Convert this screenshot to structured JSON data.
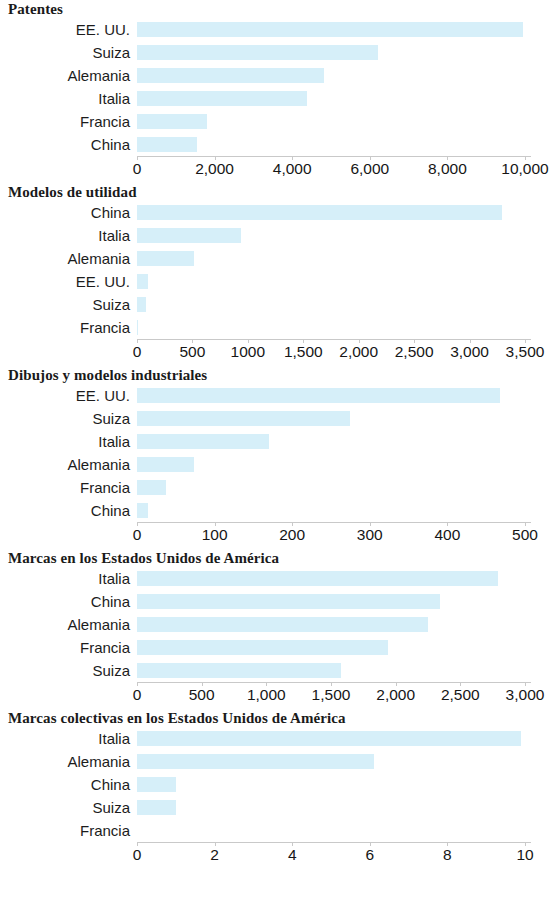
{
  "page": {
    "bar_color": "#d6eff9",
    "axis_color": "#c9c9c9",
    "text_color": "#1c1c1c"
  },
  "chart_data": [
    {
      "type": "bar",
      "orientation": "horizontal",
      "title": "Patentes",
      "xlabel": "",
      "ylabel": "",
      "categories": [
        "EE. UU.",
        "Suiza",
        "Alemania",
        "Italia",
        "Francia",
        "China"
      ],
      "values": [
        9950,
        6200,
        4830,
        4380,
        1800,
        1540
      ],
      "xlim": [
        0,
        10000
      ],
      "ticks": [
        0,
        2000,
        4000,
        6000,
        8000,
        10000
      ],
      "tick_labels": [
        "0",
        "2,000",
        "4,000",
        "6,000",
        "8,000",
        "10,000"
      ],
      "grid": false,
      "legend": "none"
    },
    {
      "type": "bar",
      "orientation": "horizontal",
      "title": "Modelos de utilidad",
      "xlabel": "",
      "ylabel": "",
      "categories": [
        "China",
        "Italia",
        "Alemania",
        "EE. UU.",
        "Suiza",
        "Francia"
      ],
      "values": [
        3290,
        940,
        510,
        95,
        85,
        10
      ],
      "xlim": [
        0,
        3500
      ],
      "ticks": [
        0,
        500,
        1000,
        1500,
        2000,
        2500,
        3000,
        3500
      ],
      "tick_labels": [
        "0",
        "500",
        "1000",
        "1,500",
        "2,000",
        "2,500",
        "3,000",
        "3,500"
      ],
      "grid": false,
      "legend": "none"
    },
    {
      "type": "bar",
      "orientation": "horizontal",
      "title": "Dibujos y modelos industriales",
      "xlabel": "",
      "ylabel": "",
      "categories": [
        "EE. UU.",
        "Suiza",
        "Italia",
        "Alemania",
        "Francia",
        "China"
      ],
      "values": [
        468,
        275,
        170,
        74,
        38,
        14
      ],
      "xlim": [
        0,
        500
      ],
      "ticks": [
        0,
        100,
        200,
        300,
        400,
        500
      ],
      "tick_labels": [
        "0",
        "100",
        "200",
        "300",
        "400",
        "500"
      ],
      "grid": false,
      "legend": "none"
    },
    {
      "type": "bar",
      "orientation": "horizontal",
      "title": "Marcas en los Estados Unidos de América",
      "xlabel": "",
      "ylabel": "",
      "categories": [
        "Italia",
        "China",
        "Alemania",
        "Francia",
        "Suiza"
      ],
      "values": [
        2790,
        2340,
        2250,
        1940,
        1580
      ],
      "xlim": [
        0,
        3000
      ],
      "ticks": [
        0,
        500,
        1000,
        1500,
        2000,
        2500,
        3000
      ],
      "tick_labels": [
        "0",
        "500",
        "1,000",
        "1,500",
        "2,000",
        "2,500",
        "3,000"
      ],
      "grid": false,
      "legend": "none"
    },
    {
      "type": "bar",
      "orientation": "horizontal",
      "title": "Marcas colectivas en los Estados Unidos de América",
      "xlabel": "",
      "ylabel": "",
      "categories": [
        "Italia",
        "Alemania",
        "China",
        "Suiza",
        "Francia"
      ],
      "values": [
        9.9,
        6.1,
        1.0,
        1.0,
        0
      ],
      "xlim": [
        0,
        10
      ],
      "ticks": [
        0,
        2,
        4,
        6,
        8,
        10
      ],
      "tick_labels": [
        "0",
        "2",
        "4",
        "6",
        "8",
        "10"
      ],
      "grid": false,
      "legend": "none"
    }
  ]
}
